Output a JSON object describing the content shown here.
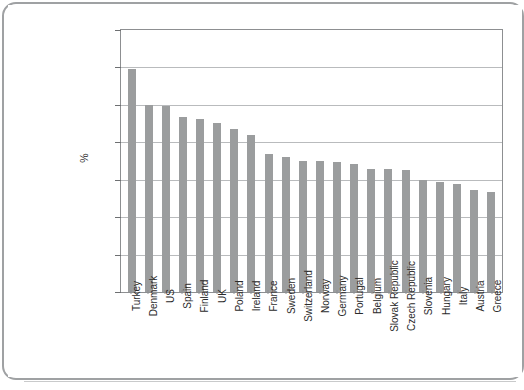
{
  "page": {
    "background_color": "#ffffff",
    "border_color": "#9fa1a3"
  },
  "chart_data": {
    "type": "bar",
    "title": "",
    "subtitle": "",
    "xlabel": "",
    "ylabel": "%",
    "ylim": [
      0,
      70
    ],
    "ytick_values": [
      0,
      10,
      20,
      30,
      40,
      50,
      60,
      70
    ],
    "ytick_labels": [
      "0",
      "10",
      "20",
      "30",
      "40",
      "50",
      "60",
      "70"
    ],
    "grid": true,
    "grid_axis": "y",
    "legend": false,
    "legend_position": "none",
    "bar_color": "#9b9d9e",
    "categories": [
      "Turkey",
      "Denmark",
      "US",
      "Spain",
      "Finland",
      "UK",
      "Poland",
      "Ireland",
      "France",
      "Sweden",
      "Switzerland",
      "Norway",
      "Germany",
      "Portugal",
      "Belgium",
      "Slovak Republic",
      "Czech Republic",
      "Slovenia",
      "Hungary",
      "Italy",
      "Austria",
      "Greece"
    ],
    "values": [
      59.7,
      50.0,
      49.6,
      46.8,
      46.3,
      45.2,
      43.5,
      42.0,
      37.0,
      36.2,
      35.1,
      35.0,
      34.8,
      34.2,
      33.0,
      32.8,
      32.7,
      30.0,
      29.4,
      28.8,
      27.3,
      26.6
    ]
  }
}
